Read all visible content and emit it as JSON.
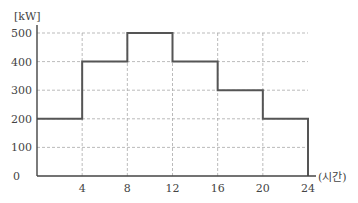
{
  "chart_data": {
    "type": "line",
    "step": true,
    "title": "",
    "xlabel": "(시간)",
    "ylabel": "[kW]",
    "x_ticks": [
      4,
      8,
      12,
      16,
      20,
      24
    ],
    "y_ticks": [
      0,
      100,
      200,
      300,
      400,
      500
    ],
    "xlim": [
      0,
      24
    ],
    "ylim": [
      0,
      500
    ],
    "grid": true,
    "legend": null,
    "series": [
      {
        "name": "load",
        "segments": [
          {
            "x_start": 0,
            "x_end": 4,
            "value": 200
          },
          {
            "x_start": 4,
            "x_end": 8,
            "value": 400
          },
          {
            "x_start": 8,
            "x_end": 12,
            "value": 500
          },
          {
            "x_start": 12,
            "x_end": 16,
            "value": 400
          },
          {
            "x_start": 16,
            "x_end": 20,
            "value": 300
          },
          {
            "x_start": 20,
            "x_end": 24,
            "value": 200
          }
        ]
      }
    ]
  },
  "labels": {
    "y_unit": "[kW]",
    "x_unit": "(시간)",
    "origin": "0"
  },
  "colors": {
    "line": "#555555",
    "grid": "#aaaaaa",
    "axis": "#444444"
  }
}
